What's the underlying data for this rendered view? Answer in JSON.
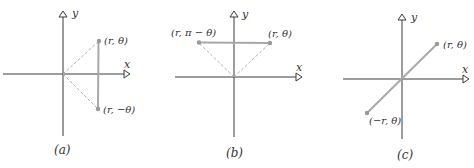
{
  "figure": {
    "panels": [
      {
        "id": "a",
        "caption": "(a)",
        "axis_x": "x",
        "axis_y": "y",
        "points": [
          {
            "label": "(r, θ)"
          },
          {
            "label": "(r, −θ)"
          }
        ]
      },
      {
        "id": "b",
        "caption": "(b)",
        "axis_x": "x",
        "axis_y": "y",
        "points": [
          {
            "label": "(r, π − θ)"
          },
          {
            "label": "(r, θ)"
          }
        ]
      },
      {
        "id": "c",
        "caption": "(c)",
        "axis_x": "x",
        "axis_y": "y",
        "points": [
          {
            "label": "(r, θ)"
          },
          {
            "label": "(−r, θ)"
          }
        ]
      }
    ],
    "colors": {
      "axis": "#3a3a3a",
      "segment": "#a8a8a8",
      "dashed": "#b0b0b0",
      "point": "#999999"
    }
  }
}
